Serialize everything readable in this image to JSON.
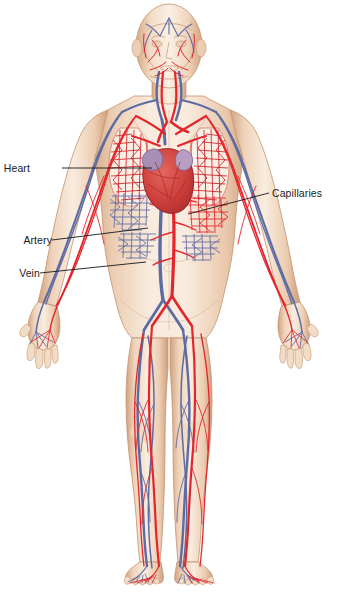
{
  "diagram": {
    "background_color": "#ffffff",
    "width": 338,
    "height": 592
  },
  "palette": {
    "artery_red": "#e4252b",
    "artery_red_dark": "#b81d22",
    "vein_blue": "#5d6ba3",
    "vein_blue_dark": "#3f4c80",
    "skin_light": "#f7e6d7",
    "skin_mid": "#edd0b6",
    "skin_shadow": "#d9ae8c",
    "outline": "#b98c6b",
    "heart_muscle": "#d9443f",
    "heart_atrium": "#a88fb5",
    "label_text": "#1a1a1a",
    "leader_line": "#15161a"
  },
  "labels": [
    {
      "id": "heart",
      "text": "Heart",
      "side": "left",
      "text_x": 30,
      "text_y": 172,
      "leader": {
        "x1": 62,
        "y1": 168,
        "x2": 152,
        "y2": 168
      }
    },
    {
      "id": "capillaries",
      "text": "Capillaries",
      "side": "right",
      "text_x": 272,
      "text_y": 197,
      "leader": {
        "x1": 269,
        "y1": 193,
        "x2": 188,
        "y2": 214
      }
    },
    {
      "id": "artery",
      "text": "Artery",
      "side": "left",
      "text_x": 14,
      "text_y": 244,
      "leader": {
        "x1": 52,
        "y1": 240,
        "x2": 148,
        "y2": 228
      }
    },
    {
      "id": "vein",
      "text": "Vein",
      "side": "left",
      "text_x": 12,
      "text_y": 277,
      "leader": {
        "x1": 40,
        "y1": 273,
        "x2": 146,
        "y2": 262
      }
    }
  ],
  "anatomy_regions": [
    {
      "name": "head",
      "detail": "bald male head with superficial temporal and facial vessels"
    },
    {
      "name": "neck",
      "detail": "carotid arteries and jugular veins"
    },
    {
      "name": "thorax",
      "detail": "heart centered between two lungs with pulmonary capillary networks"
    },
    {
      "name": "abdomen",
      "detail": "aorta and inferior vena cava with abdominal capillary beds"
    },
    {
      "name": "arms",
      "detail": "brachial arteries and cephalic veins crossing down to the hands"
    },
    {
      "name": "hands",
      "detail": "digital arteries and veins in spread fingers"
    },
    {
      "name": "legs",
      "detail": "femoral artery and great saphenous vein running full length"
    },
    {
      "name": "feet",
      "detail": "dorsal arch vessels and toe capillaries"
    }
  ]
}
